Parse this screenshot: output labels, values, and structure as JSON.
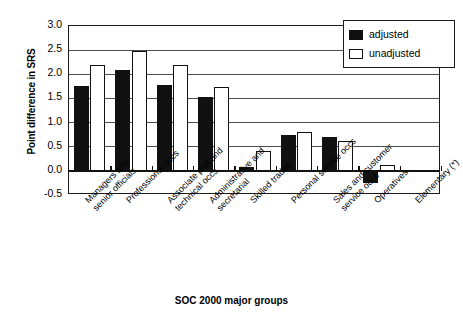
{
  "chart_data": {
    "type": "bar",
    "title": "",
    "xlabel": "SOC 2000 major groups",
    "ylabel": "Point difference in SRS",
    "ylim": [
      -0.5,
      3.0
    ],
    "ytick_step": 0.5,
    "yticks": [
      "3.0",
      "2.5",
      "2.0",
      "1.5",
      "1.0",
      "0.5",
      "0.0",
      "-0.5"
    ],
    "grid": true,
    "legend_position": "top-right",
    "categories": [
      "Managers and senior officials",
      "Professional occs",
      "Associate prof and technical occs",
      "Administrative and secretarial",
      "Skilled trades",
      "Personal service occs",
      "Sales and customer service occs",
      "Operatives",
      "Elementary (*)"
    ],
    "category_lines": [
      [
        "Managers and",
        "senior officials"
      ],
      [
        "Professional occs"
      ],
      [
        "Associate prof and",
        "technical occs"
      ],
      [
        "Administrative and",
        "secretarial"
      ],
      [
        "Skilled trades"
      ],
      [
        "Personal service occs"
      ],
      [
        "Sales and customer",
        "service occs"
      ],
      [
        "Operatives"
      ],
      [
        "Elementary (*)"
      ]
    ],
    "series": [
      {
        "name": "adjusted",
        "color": "#111111",
        "values": [
          1.75,
          2.08,
          1.77,
          1.52,
          0.08,
          0.75,
          0.7,
          -0.25,
          null
        ]
      },
      {
        "name": "unadjusted",
        "color": "#ffffff",
        "values": [
          2.2,
          2.48,
          2.2,
          1.74,
          0.42,
          0.8,
          0.62,
          0.13,
          null
        ]
      }
    ]
  },
  "legend": {
    "items": [
      {
        "label": "adjusted",
        "style": "adj"
      },
      {
        "label": "unadjusted",
        "style": "unadj"
      }
    ]
  }
}
